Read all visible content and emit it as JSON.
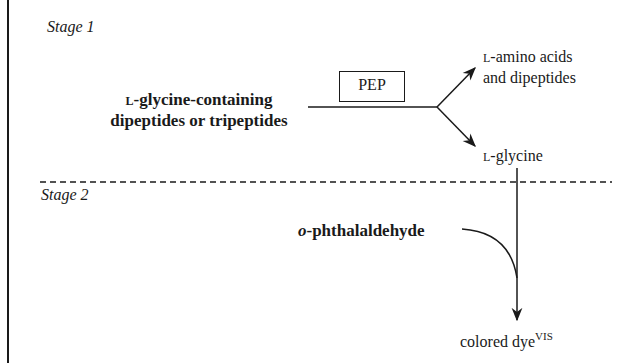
{
  "stages": {
    "stage1_label": "Stage 1",
    "stage2_label": "Stage 2"
  },
  "substrate": {
    "prefix": "L",
    "line1_rest": "-glycine-containing",
    "line2": "dipeptides or tripeptides"
  },
  "enzyme": {
    "label": "PEP"
  },
  "products": {
    "upper": {
      "prefix": "L",
      "line1_rest": "-amino acids",
      "line2": "and dipeptides"
    },
    "lower": {
      "prefix": "L",
      "rest": "-glycine"
    }
  },
  "reagent": {
    "italic_prefix": "o",
    "rest": "-phthalaldehyde"
  },
  "final_product": {
    "label": "colored dye",
    "superscript": "VIS"
  },
  "colors": {
    "ink": "#1a1a1a",
    "background": "#ffffff"
  }
}
